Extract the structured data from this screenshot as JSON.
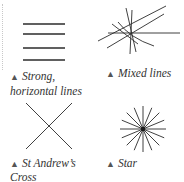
{
  "figures": [
    {
      "id": "strong-horizontal",
      "caption_marker": "▲",
      "caption_line1": "Strong,",
      "caption_line2": "horizontal lines"
    },
    {
      "id": "mixed",
      "caption_marker": "▲",
      "caption_line1": "Mixed lines"
    },
    {
      "id": "st-andrews",
      "caption_marker": "▲",
      "caption_line1": "St Andrew’s",
      "caption_line2": "Cross"
    },
    {
      "id": "star",
      "caption_marker": "▲",
      "caption_line1": "Star"
    }
  ],
  "colors": {
    "line": "#2b2b2b",
    "marker": "#555555",
    "text": "#333333"
  }
}
